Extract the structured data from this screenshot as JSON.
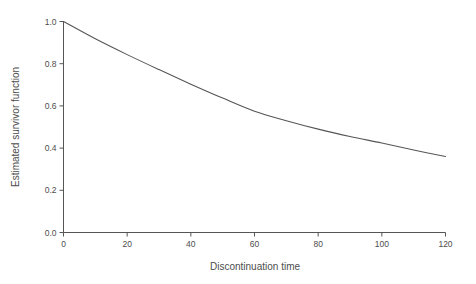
{
  "figure": {
    "background": "#ffffff"
  },
  "chart_data": {
    "type": "line",
    "title": "",
    "xlabel": "Discontinuation time",
    "ylabel": "Estimated survivor function",
    "x": [
      0,
      10,
      20,
      30,
      40,
      50,
      60,
      70,
      80,
      90,
      100,
      110,
      120
    ],
    "series": [
      {
        "name": "Estimated survivor function",
        "values": [
          1.0,
          0.918,
          0.843,
          0.772,
          0.703,
          0.637,
          0.575,
          0.53,
          0.49,
          0.455,
          0.424,
          0.391,
          0.36
        ]
      }
    ],
    "xlim": [
      0,
      120
    ],
    "ylim": [
      0.0,
      1.0
    ],
    "x_ticks": [
      0,
      20,
      40,
      60,
      80,
      100,
      120
    ],
    "x_tick_labels": [
      "0",
      "20",
      "40",
      "60",
      "80",
      "100",
      "120"
    ],
    "y_ticks": [
      0.0,
      0.2,
      0.4,
      0.6,
      0.8,
      1.0
    ],
    "y_tick_labels": [
      "0.0",
      "0.2",
      "0.4",
      "0.6",
      "0.8",
      "1.0"
    ],
    "grid": false,
    "legend": "none",
    "colors": {
      "line": "#565656",
      "axis": "#565656",
      "text": "#4d4d4d",
      "background": "#ffffff"
    }
  }
}
